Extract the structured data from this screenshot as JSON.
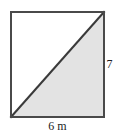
{
  "figure": {
    "type": "geometry-diagram",
    "shape": "square-with-diagonal",
    "square": {
      "left": 11,
      "top": 12,
      "right": 104,
      "bottom": 117,
      "stroke_color": "#4a4a4a",
      "stroke_width": 2,
      "fill_color": "#ffffff"
    },
    "diagonal": {
      "from": "bottom-left",
      "to": "top-right",
      "x1": 11,
      "y1": 117,
      "x2": 104,
      "y2": 12,
      "stroke_color": "#3a3a3a",
      "stroke_width": 2
    },
    "shaded_region": {
      "name": "lower-right-triangle",
      "fill_color": "#e3e3e3",
      "vertices": "bottom-left, bottom-right, top-right"
    },
    "background_color": "#ffffff"
  },
  "labels": {
    "height": "7",
    "base": "6 m"
  }
}
